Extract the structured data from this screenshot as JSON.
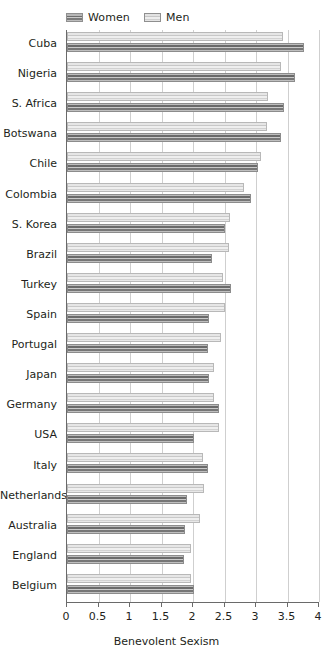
{
  "chart_data": {
    "type": "bar",
    "orientation": "horizontal",
    "title": "",
    "subtitle": "",
    "xlabel": "Benevolent Sexism",
    "ylabel": "",
    "xlim": [
      0,
      4
    ],
    "ylim": null,
    "grid": true,
    "grid_axis": "x",
    "legend_position": "top-left",
    "xticks": [
      0,
      0.5,
      1,
      1.5,
      2,
      2.5,
      3,
      3.5,
      4
    ],
    "xtick_labels": [
      "0",
      "0.5",
      "1",
      "1.5",
      "2",
      "2.5",
      "3",
      "3.5",
      "4"
    ],
    "categories": [
      "Cuba",
      "Nigeria",
      "S. Africa",
      "Botswana",
      "Chile",
      "Colombia",
      "S. Korea",
      "Brazil",
      "Turkey",
      "Spain",
      "Portugal",
      "Japan",
      "Germany",
      "USA",
      "Italy",
      "Netherlands",
      "Australia",
      "England",
      "Belgium"
    ],
    "series": [
      {
        "name": "Women",
        "color": "#767676",
        "values": [
          3.76,
          3.62,
          3.44,
          3.4,
          3.03,
          2.92,
          2.51,
          2.3,
          2.6,
          2.26,
          2.24,
          2.26,
          2.42,
          2.01,
          2.24,
          1.9,
          1.88,
          1.86,
          2.02
        ]
      },
      {
        "name": "Men",
        "color": "#d8d8d8",
        "values": [
          3.43,
          3.4,
          3.19,
          3.17,
          3.08,
          2.81,
          2.59,
          2.57,
          2.47,
          2.51,
          2.44,
          2.34,
          2.34,
          2.42,
          2.16,
          2.18,
          2.11,
          1.97,
          1.97
        ]
      }
    ]
  },
  "legend": {
    "items": [
      {
        "label": "Women",
        "key": "women"
      },
      {
        "label": "Men",
        "key": "men"
      }
    ]
  },
  "axis": {
    "x_title": "Benevolent Sexism"
  }
}
